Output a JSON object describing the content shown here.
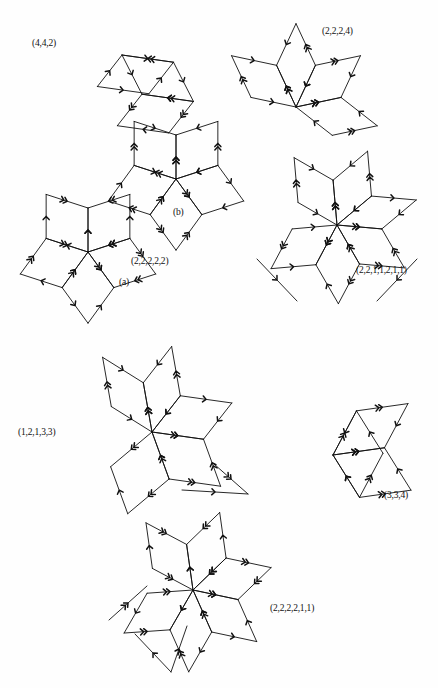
{
  "page": {
    "kind": "mathematical-figure-plate",
    "background_color": "#fefefe",
    "ink_color": "#111111",
    "width": 438,
    "height": 688
  },
  "figures": [
    {
      "id": "fig-442",
      "label": "(4,4,2)",
      "label_x": 32,
      "label_y": 39,
      "center": [
        130,
        55
      ],
      "rhombus_count": 3,
      "description": "three-rhombus slanted hexagon tiling with chevron-marked directed edges"
    },
    {
      "id": "fig-2224",
      "label": "(2,2,2,4)",
      "label_x": 322,
      "label_y": 27,
      "center": [
        296,
        96
      ],
      "rhombus_count": 4,
      "description": "four rhombi radiating from a common vertex"
    },
    {
      "id": "fig-b",
      "label": "(b)",
      "label_x": 173,
      "label_y": 208,
      "center": [
        176,
        175
      ],
      "rhombus_count": 5,
      "description": "five-fold rhombic star, sub-figure b"
    },
    {
      "id": "fig-22222",
      "label": "(2,2,2,2,2)",
      "label_x": 131,
      "label_y": 257,
      "center": [
        87,
        250
      ],
      "rhombus_count": 5,
      "description": "five-fold rhombic star"
    },
    {
      "id": "fig-a",
      "label": "(a)",
      "label_x": 119,
      "label_y": 278,
      "center": [
        87,
        250
      ],
      "rhombus_count": 5,
      "description": "label for the five-fold rhombic star, sub-figure a"
    },
    {
      "id": "fig-2211211",
      "label": "(2,2,1,1,2,1,1)",
      "label_x": 356,
      "label_y": 266,
      "center": [
        336,
        222
      ],
      "rhombus_count": 6,
      "description": "six-fold rhombic star with reflex spikes"
    },
    {
      "id": "fig-12133",
      "label": "(1,2,1,3,3)",
      "label_x": 18,
      "label_y": 428,
      "center": [
        152,
        425
      ],
      "rhombus_count": 5,
      "description": "five rhombi meeting at a central vertex, irregular outline"
    },
    {
      "id": "fig-334",
      "label": "(3,3,4)",
      "label_x": 384,
      "label_y": 491,
      "center": [
        340,
        448
      ],
      "rhombus_count": 3,
      "description": "three rhombi forming a cube-like hexagon"
    },
    {
      "id": "fig-222211",
      "label": "(2,2,2,2,1,1)",
      "label_x": 270,
      "label_y": 604,
      "center": [
        193,
        592
      ],
      "rhombus_count": 6,
      "description": "six rhombi in a star with two reflex spikes"
    }
  ],
  "edge_markings": {
    "single_chevron": "one arrowhead",
    "double_chevron": "two stacked arrowheads",
    "meaning": "directed edge-class markers on each rhombus side"
  }
}
